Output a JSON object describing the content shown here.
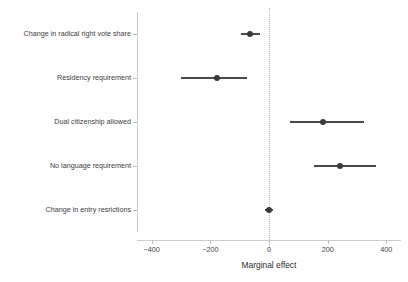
{
  "chart_data": {
    "type": "scatter",
    "title": "",
    "subtitle": "",
    "xlabel": "Marginal effect",
    "ylabel": "",
    "xlim": [
      -450,
      450
    ],
    "xticks": [
      -400,
      -200,
      0,
      200,
      400
    ],
    "xtick_labels": [
      "−400",
      "−200",
      "0",
      "200",
      "400"
    ],
    "grid": false,
    "legend": null,
    "reference_line": {
      "x": 0,
      "style": "dotted",
      "color": "#b9b9b9"
    },
    "orientation": "horizontal",
    "marker": "circle",
    "error_bar_style": "horizontal-line",
    "categories": [
      "Change in radical right vote share",
      "Residency requirement",
      "Dual citizenship allowed",
      "No language requirement",
      "Change in entry resrictions"
    ],
    "values": [
      -65,
      -177,
      184,
      242,
      0
    ],
    "ci_low": [
      -97,
      -300,
      71,
      152,
      -13
    ],
    "ci_high": [
      -32,
      -74,
      323,
      365,
      13
    ],
    "points": [
      {
        "label": "Change in radical right vote share",
        "estimate": -65,
        "ci_low": -97,
        "ci_high": -32
      },
      {
        "label": "Residency requirement",
        "estimate": -177,
        "ci_low": -300,
        "ci_high": -74
      },
      {
        "label": "Dual citizenship allowed",
        "estimate": 184,
        "ci_low": 71,
        "ci_high": 323
      },
      {
        "label": "No language requirement",
        "estimate": 242,
        "ci_low": 152,
        "ci_high": 365
      },
      {
        "label": "Change in entry resrictions",
        "estimate": 0,
        "ci_low": -13,
        "ci_high": 13
      }
    ],
    "colors": {
      "point": "#3a3a3a",
      "interval": "#4a4a4a",
      "axis": "#cccccc",
      "tick": "#bdbdbd",
      "text": "#3c3c3c",
      "background": "#ffffff",
      "reference_line": "#b9b9b9"
    }
  }
}
